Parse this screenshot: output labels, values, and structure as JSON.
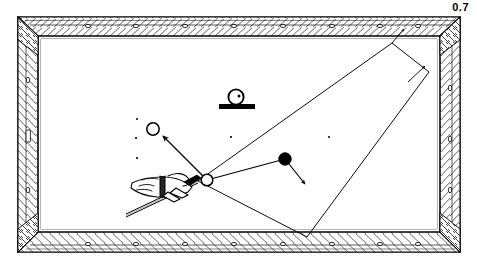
{
  "figure": {
    "label": "0.7",
    "caption_number": "0.7"
  },
  "colors": {
    "ink": "#000000",
    "cloth": "#ffffff",
    "rail_wood": "#ffffff",
    "background": "#ffffff"
  },
  "table": {
    "name": "billiard-table",
    "outer_rect": {
      "x": 18,
      "y": 17,
      "w": 442,
      "h": 235
    },
    "inner_rect": {
      "x": 38,
      "y": 36,
      "w": 402,
      "h": 196
    },
    "rail_sights_top": 8,
    "rail_sights_bottom": 8,
    "rail_sights_left": 3,
    "rail_sights_right": 3
  },
  "cloth_spots": [
    {
      "name": "spot-left-upper",
      "x": 137,
      "y": 119
    },
    {
      "name": "spot-left-middle",
      "x": 136,
      "y": 138
    },
    {
      "name": "spot-left-lower",
      "x": 137,
      "y": 158
    },
    {
      "name": "spot-center",
      "x": 231,
      "y": 137
    },
    {
      "name": "spot-right",
      "x": 329,
      "y": 137
    }
  ],
  "balls": [
    {
      "name": "object-ball-white",
      "kind": "outline",
      "x": 153,
      "y": 129,
      "r": 6.2,
      "label": ""
    },
    {
      "name": "cue-ball",
      "kind": "outline",
      "x": 207,
      "y": 180,
      "r": 6.0,
      "label": ""
    },
    {
      "name": "target-ball-black",
      "kind": "filled",
      "x": 285,
      "y": 159,
      "r": 6.0,
      "label": ""
    },
    {
      "name": "ball-on-block",
      "kind": "outline-with-pip",
      "x": 236,
      "y": 97,
      "r": 8.0,
      "label": ""
    }
  ],
  "block": {
    "name": "support-block",
    "x": 219,
    "y": 105,
    "w": 36,
    "h": 5
  },
  "arrows": [
    {
      "name": "cue-ball-deflection-arrow",
      "from": {
        "x": 207,
        "y": 180
      },
      "to": {
        "x": 160,
        "y": 134
      }
    },
    {
      "name": "target-ball-travel-arrow",
      "from": {
        "x": 289,
        "y": 164
      },
      "to": {
        "x": 305,
        "y": 183
      }
    },
    {
      "name": "rail-path-arrow",
      "from": {
        "x": 410,
        "y": 79
      },
      "to": {
        "x": 424,
        "y": 65
      }
    },
    {
      "name": "corner-pocket-arrow",
      "from": {
        "x": 382,
        "y": 47
      },
      "to": {
        "x": 401,
        "y": 31
      }
    }
  ],
  "paths": [
    {
      "name": "shot-line-primary",
      "points": "207,180 285,159"
    },
    {
      "name": "quadrilateral-path",
      "points": "392,43 429,72 307,237 198,181"
    },
    {
      "name": "corner-leader-line",
      "points": "392,43 404,29"
    }
  ],
  "cue": {
    "name": "cue-stick",
    "tip": {
      "x": 196,
      "y": 181
    },
    "butt": {
      "x": 128,
      "y": 218
    },
    "width": 3.4
  },
  "hand": {
    "name": "player-hand-bridge",
    "description": "hand forming a bridge on the table supporting the cue"
  }
}
